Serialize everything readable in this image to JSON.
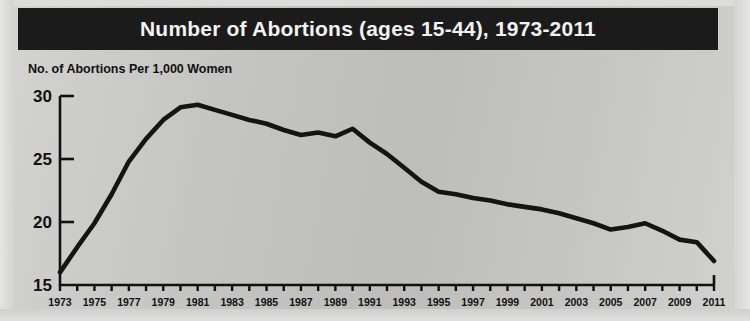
{
  "figure": {
    "title": "Number of Abortions (ages 15-44), 1973-2011",
    "title_bar_color": "#1b1b1b",
    "title_text_color": "#f2f2f2",
    "background_color": "#c4c4c2",
    "line_color": "#141414"
  },
  "chart_data": {
    "type": "line",
    "title": "Number of Abortions (ages 15-44), 1973-2011",
    "ylabel": "No. of Abortions Per 1,000 Women",
    "xlabel": "",
    "ylim": [
      15,
      30
    ],
    "yticks": [
      15,
      20,
      25,
      30
    ],
    "ytick_labels": [
      "15",
      "20",
      "25",
      "30"
    ],
    "xlim": [
      1973,
      2011
    ],
    "xticks": [
      1973,
      1975,
      1977,
      1979,
      1981,
      1983,
      1985,
      1987,
      1989,
      1991,
      1993,
      1995,
      1997,
      1999,
      2001,
      2003,
      2005,
      2007,
      2009,
      2011
    ],
    "xtick_labels": [
      "1973",
      "1975",
      "1977",
      "1979",
      "1981",
      "1983",
      "1985",
      "1987",
      "1989",
      "1991",
      "1993",
      "1995",
      "1997",
      "1999",
      "2001",
      "2003",
      "2005",
      "2007",
      "2009",
      "2011"
    ],
    "minor_xticks_every": 1,
    "grid": false,
    "legend": null,
    "x": [
      1973,
      1974,
      1975,
      1976,
      1977,
      1978,
      1979,
      1980,
      1981,
      1982,
      1983,
      1984,
      1985,
      1986,
      1987,
      1988,
      1989,
      1990,
      1991,
      1992,
      1993,
      1994,
      1995,
      1996,
      1997,
      1998,
      1999,
      2000,
      2001,
      2002,
      2003,
      2004,
      2005,
      2006,
      2007,
      2008,
      2009,
      2010,
      2011
    ],
    "values": [
      16.0,
      18.0,
      19.9,
      22.2,
      24.8,
      26.6,
      28.1,
      29.1,
      29.3,
      28.9,
      28.5,
      28.1,
      27.8,
      27.3,
      26.9,
      27.1,
      26.8,
      27.4,
      26.3,
      25.4,
      24.3,
      23.2,
      22.4,
      22.2,
      21.9,
      21.7,
      21.4,
      21.2,
      21.0,
      20.7,
      20.3,
      19.9,
      19.4,
      19.6,
      19.9,
      19.3,
      18.6,
      18.4,
      16.9
    ],
    "series_name": "No. of Abortions Per 1,000 Women"
  }
}
